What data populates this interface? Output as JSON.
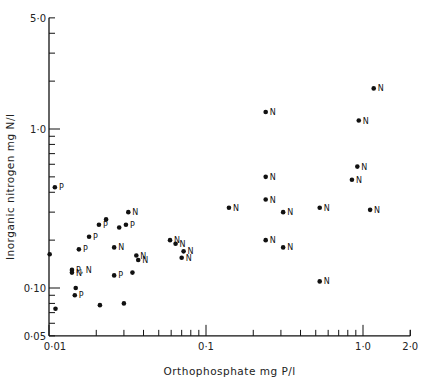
{
  "chart_data": {
    "type": "scatter",
    "title": "",
    "xlabel": "Orthophosphate  mg P/l",
    "ylabel": "Inorganic nitrogen  mg N/l",
    "xscale": "log",
    "yscale": "log",
    "xlim": [
      0.01,
      2.0
    ],
    "ylim": [
      0.05,
      5.0
    ],
    "x_tick_labels": [
      "0·01",
      "0·1",
      "1·0",
      "2·0"
    ],
    "y_tick_labels": [
      "0·05",
      "0·10",
      "1·0",
      "5·0"
    ],
    "grid": false,
    "reference_lines": [
      {
        "label": "N:P = 20:1",
        "ratio": 20
      },
      {
        "label": "N:P = 10:1",
        "ratio": 10
      }
    ],
    "points": [
      {
        "x": 0.0109,
        "y": 0.43,
        "label": "P"
      },
      {
        "x": 0.0101,
        "y": 0.163,
        "label": ""
      },
      {
        "x": 0.011,
        "y": 0.074,
        "label": ""
      },
      {
        "x": 0.014,
        "y": 0.13,
        "label": "P, N"
      },
      {
        "x": 0.014,
        "y": 0.125,
        "label": "N"
      },
      {
        "x": 0.0148,
        "y": 0.1,
        "label": ""
      },
      {
        "x": 0.0146,
        "y": 0.09,
        "label": "P"
      },
      {
        "x": 0.0155,
        "y": 0.175,
        "label": "P"
      },
      {
        "x": 0.018,
        "y": 0.21,
        "label": "P"
      },
      {
        "x": 0.0208,
        "y": 0.25,
        "label": "P"
      },
      {
        "x": 0.0231,
        "y": 0.27,
        "label": ""
      },
      {
        "x": 0.0211,
        "y": 0.078,
        "label": ""
      },
      {
        "x": 0.026,
        "y": 0.18,
        "label": "N"
      },
      {
        "x": 0.026,
        "y": 0.12,
        "label": "P"
      },
      {
        "x": 0.028,
        "y": 0.24,
        "label": ""
      },
      {
        "x": 0.0309,
        "y": 0.25,
        "label": "P"
      },
      {
        "x": 0.032,
        "y": 0.3,
        "label": "N"
      },
      {
        "x": 0.03,
        "y": 0.08,
        "label": ""
      },
      {
        "x": 0.034,
        "y": 0.125,
        "label": ""
      },
      {
        "x": 0.036,
        "y": 0.16,
        "label": "N"
      },
      {
        "x": 0.037,
        "y": 0.15,
        "label": "N"
      },
      {
        "x": 0.059,
        "y": 0.2,
        "label": "N"
      },
      {
        "x": 0.064,
        "y": 0.19,
        "label": "N"
      },
      {
        "x": 0.072,
        "y": 0.17,
        "label": "N"
      },
      {
        "x": 0.07,
        "y": 0.155,
        "label": "N"
      },
      {
        "x": 0.14,
        "y": 0.32,
        "label": "N"
      },
      {
        "x": 0.24,
        "y": 1.28,
        "label": "N"
      },
      {
        "x": 0.24,
        "y": 0.5,
        "label": "N"
      },
      {
        "x": 0.24,
        "y": 0.36,
        "label": "N"
      },
      {
        "x": 0.31,
        "y": 0.3,
        "label": "N"
      },
      {
        "x": 0.24,
        "y": 0.2,
        "label": "N"
      },
      {
        "x": 0.31,
        "y": 0.18,
        "label": "N"
      },
      {
        "x": 0.53,
        "y": 0.32,
        "label": "N"
      },
      {
        "x": 0.53,
        "y": 0.11,
        "label": "N"
      },
      {
        "x": 0.85,
        "y": 0.48,
        "label": "N"
      },
      {
        "x": 0.92,
        "y": 0.58,
        "label": "N"
      },
      {
        "x": 0.94,
        "y": 1.13,
        "label": "N"
      },
      {
        "x": 1.17,
        "y": 1.8,
        "label": "N"
      },
      {
        "x": 1.11,
        "y": 0.31,
        "label": "N"
      }
    ]
  }
}
